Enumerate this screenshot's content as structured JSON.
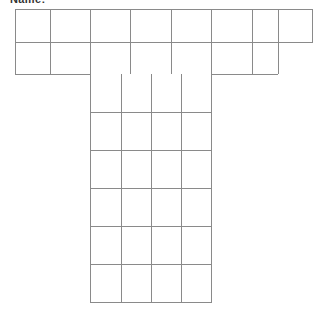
{
  "page": {
    "background_color": "#ffffff",
    "width": 315,
    "height": 311
  },
  "heading": {
    "text": "Name:",
    "note": "clipped by top edge of screenshot",
    "color": "#333333"
  },
  "grid": {
    "title": "blank worksheet grid",
    "shape": "T-shape",
    "line_color": "#8a8a8a",
    "cell_fill": "#ffffff",
    "line_width": 1,
    "bands": [
      {
        "name": "top-band-row-1",
        "row_index": 1,
        "x_start": 15,
        "x_end": 313,
        "y_start": 9,
        "y_end": 42,
        "column_edges": [
          15,
          50,
          90,
          130,
          172,
          212,
          252,
          278,
          313
        ],
        "cell_count": 8
      },
      {
        "name": "top-band-row-2",
        "row_index": 2,
        "x_start": 15,
        "x_end": 278,
        "y_start": 42,
        "y_end": 74,
        "column_edges": [
          15,
          50,
          90,
          130,
          172,
          212,
          252,
          278
        ],
        "cell_count": 7
      },
      {
        "name": "stem",
        "x_start": 90,
        "x_end": 212,
        "y_start": 74,
        "y_end": 303,
        "column_edges": [
          90,
          121,
          151,
          181,
          212
        ],
        "row_edges": [
          74,
          112,
          150,
          188,
          226,
          265,
          303
        ],
        "columns": 4,
        "rows": 6,
        "cell_count": 24
      }
    ],
    "total_cells": 39
  }
}
